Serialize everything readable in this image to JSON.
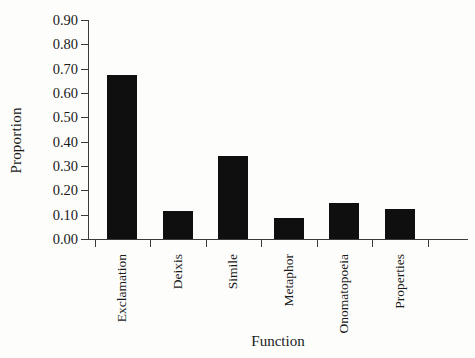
{
  "chart_data": {
    "type": "bar",
    "title": "",
    "xlabel": "Function",
    "ylabel": "Proportion",
    "categories": [
      "Exclamation",
      "Deixis",
      "Simile",
      "Metaphor",
      "Onomatopoeia",
      "Properties"
    ],
    "values": [
      0.675,
      0.115,
      0.34,
      0.085,
      0.15,
      0.125
    ],
    "ylim": [
      0.0,
      0.9
    ],
    "ytick_labels": [
      "0.00",
      "0.10",
      "0.20",
      "0.30",
      "0.40",
      "0.50",
      "0.60",
      "0.70",
      "0.80",
      "0.90"
    ],
    "ytick_values": [
      0.0,
      0.1,
      0.2,
      0.3,
      0.4,
      0.5,
      0.6,
      0.7,
      0.8,
      0.9
    ],
    "grid": false,
    "legend": null,
    "bar_color": "#100f0f",
    "axis_color": "#3b3b3b",
    "background_color": "#fdfdfb"
  }
}
